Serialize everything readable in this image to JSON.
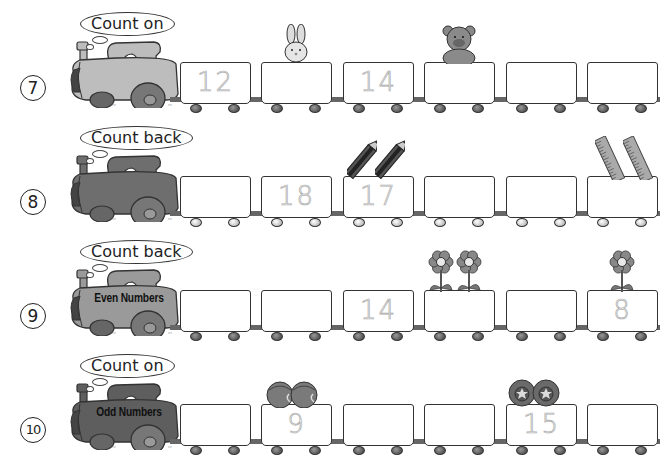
{
  "worksheet": {
    "rows": [
      {
        "number": "7",
        "instruction": "Count on",
        "engine_label": "",
        "engine_color": "#bdbdbd",
        "cars": [
          "12",
          "",
          "14",
          "",
          "",
          ""
        ],
        "decorations": [
          {
            "type": "rabbit-icon",
            "car": 1
          },
          {
            "type": "teddy-bear-icon",
            "car": 3
          }
        ]
      },
      {
        "number": "8",
        "instruction": "Count back",
        "engine_label": "",
        "engine_color": "#6e6e6e",
        "cars": [
          "",
          "18",
          "17",
          "",
          "",
          ""
        ],
        "decorations": [
          {
            "type": "pencil-icon",
            "car": 2,
            "count": 2
          },
          {
            "type": "ruler-icon",
            "car": 5,
            "count": 2
          }
        ]
      },
      {
        "number": "9",
        "instruction": "Count back",
        "engine_label": "Even Numbers",
        "engine_color": "#9a9a9a",
        "cars": [
          "",
          "",
          "14",
          "",
          "",
          "8"
        ],
        "decorations": [
          {
            "type": "flower-icon",
            "car": 3,
            "count": 2
          },
          {
            "type": "flower-icon",
            "car": 5,
            "count": 1
          }
        ]
      },
      {
        "number": "10",
        "instruction": "Count on",
        "engine_label": "Odd Numbers",
        "engine_color": "#5e5e5e",
        "cars": [
          "",
          "9",
          "",
          "",
          "15",
          ""
        ],
        "decorations": [
          {
            "type": "ball-icon",
            "car": 1,
            "count": 2
          },
          {
            "type": "star-ball-icon",
            "car": 4,
            "count": 2
          }
        ]
      }
    ]
  }
}
